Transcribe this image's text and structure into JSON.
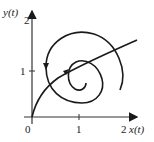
{
  "diagram": {
    "type": "phase-portrait",
    "axes": {
      "x_label": "x(t)",
      "y_label": "y(t)",
      "x_ticks": [
        "0",
        "1",
        "2"
      ],
      "y_ticks": [
        "1",
        "2"
      ]
    },
    "origin_label": "0",
    "stroke_color": "#1a1a1a",
    "curve": "spiral trajectory starting at origin, crossing outward, looping counterclockwise inward"
  }
}
